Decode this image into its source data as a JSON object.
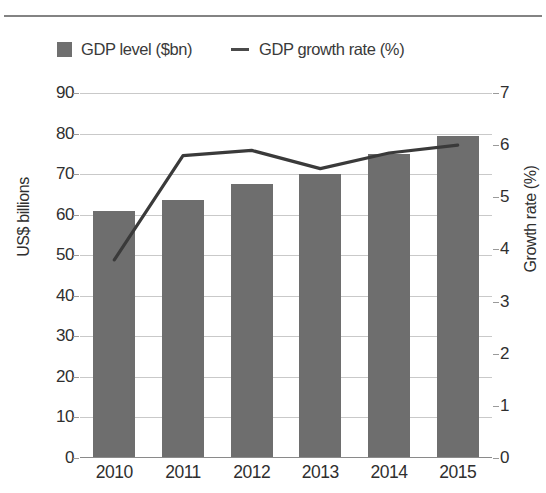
{
  "legend": {
    "bars_label": "GDP level ($bn)",
    "line_label": "GDP growth rate (%)",
    "bars_swatch_icon": "filled-square-icon",
    "line_swatch_icon": "horizontal-dash-icon"
  },
  "axes": {
    "left_title": "US$ billions",
    "right_title": "Growth rate (%)",
    "left_ticks": [
      "90",
      "80",
      "70",
      "60",
      "50",
      "40",
      "30",
      "20",
      "10",
      "0"
    ],
    "right_ticks": [
      "7",
      "6",
      "5",
      "4",
      "3",
      "2",
      "1",
      "0"
    ]
  },
  "colors": {
    "bar_fill": "#6e6e6e",
    "line_stroke": "#3a3a3a",
    "gridline": "#c9c9c9",
    "axis": "#8a8a8a",
    "text": "#2f2f2f"
  },
  "chart_data": {
    "type": "bar",
    "title": "",
    "subtitle": "",
    "xlabel": "",
    "ylabel": "US$ billions",
    "y2label": "Growth rate (%)",
    "categories": [
      "2010",
      "2011",
      "2012",
      "2013",
      "2014",
      "2015"
    ],
    "ylim": [
      0,
      90
    ],
    "y2lim": [
      0,
      7
    ],
    "yticks": [
      0,
      10,
      20,
      30,
      40,
      50,
      60,
      70,
      80,
      90
    ],
    "y2ticks": [
      0,
      1,
      2,
      3,
      4,
      5,
      6,
      7
    ],
    "grid": true,
    "legend_position": "top",
    "series": [
      {
        "name": "GDP level ($bn)",
        "type": "bar",
        "axis": "left",
        "values": [
          61,
          63.5,
          67.5,
          70,
          75,
          79.5
        ]
      },
      {
        "name": "GDP growth rate (%)",
        "type": "line",
        "axis": "right",
        "values": [
          3.8,
          5.8,
          5.9,
          5.55,
          5.85,
          6.0
        ]
      }
    ]
  }
}
